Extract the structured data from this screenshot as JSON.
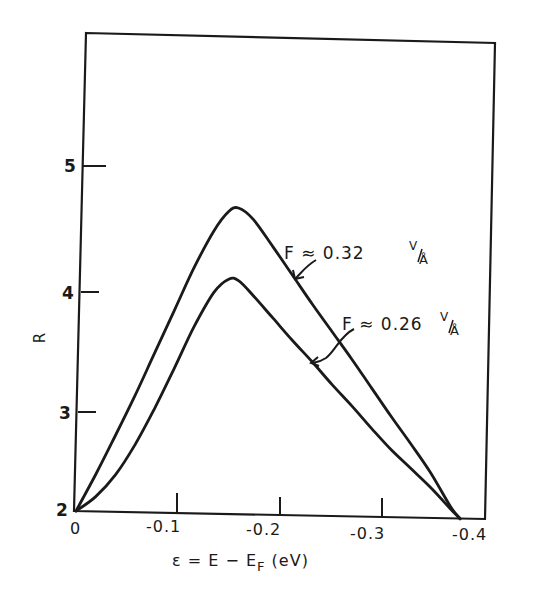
{
  "chart_data": {
    "type": "line",
    "title": "",
    "xlabel": "ε = E − E_F (eV)",
    "xlabel_parts": {
      "prefix": "ε = E − E",
      "subscript": "F",
      "suffix": " (eV)"
    },
    "ylabel": "R",
    "xlim": [
      0,
      -0.4
    ],
    "ylim": [
      2,
      5.9
    ],
    "grid": false,
    "legend_position": "inline-annotations",
    "x_ticks": [
      0,
      -0.1,
      -0.2,
      -0.3,
      -0.4
    ],
    "x_tick_labels": [
      "0",
      "-0.1",
      "-0.2",
      "-0.3",
      "-0.4"
    ],
    "y_ticks": [
      2,
      3,
      4,
      5
    ],
    "y_tick_labels": [
      "2",
      "3",
      "4",
      "5"
    ],
    "series": [
      {
        "name": "F ≈ 0.32 V/Å",
        "label_main": "F ≈ 0.32",
        "label_unit": "V/Å",
        "x": [
          0,
          -0.02,
          -0.04,
          -0.06,
          -0.08,
          -0.1,
          -0.12,
          -0.14,
          -0.155,
          -0.165,
          -0.18,
          -0.2,
          -0.22,
          -0.24,
          -0.26,
          -0.28,
          -0.3,
          -0.32,
          -0.34,
          -0.36,
          -0.38,
          -0.39
        ],
        "y": [
          2.0,
          2.3,
          2.62,
          2.95,
          3.3,
          3.65,
          4.0,
          4.3,
          4.46,
          4.49,
          4.4,
          4.18,
          3.95,
          3.72,
          3.5,
          3.28,
          3.05,
          2.82,
          2.6,
          2.37,
          2.1,
          2.0
        ]
      },
      {
        "name": "F ≈ 0.26 V/Å",
        "label_main": "F ≈ 0.26",
        "label_unit": "V/Å",
        "x": [
          0,
          -0.02,
          -0.04,
          -0.06,
          -0.08,
          -0.1,
          -0.12,
          -0.14,
          -0.155,
          -0.165,
          -0.18,
          -0.2,
          -0.22,
          -0.24,
          -0.26,
          -0.28,
          -0.3,
          -0.32,
          -0.34,
          -0.36,
          -0.38,
          -0.39
        ],
        "y": [
          2.0,
          2.12,
          2.3,
          2.55,
          2.85,
          3.18,
          3.52,
          3.8,
          3.91,
          3.9,
          3.78,
          3.6,
          3.42,
          3.25,
          3.07,
          2.9,
          2.72,
          2.55,
          2.4,
          2.25,
          2.08,
          2.0
        ]
      }
    ],
    "annotations": [
      {
        "text": "F ≈ 0.32 V/Å",
        "points_to_series": 0,
        "near_x": -0.195
      },
      {
        "text": "F ≈ 0.26 V/Å",
        "points_to_series": 1,
        "near_x": -0.225
      }
    ]
  }
}
